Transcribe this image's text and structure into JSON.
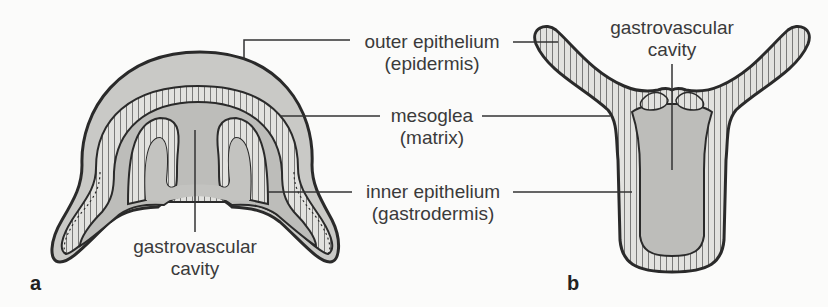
{
  "figure": {
    "panels": [
      {
        "id": "a",
        "label": "a"
      },
      {
        "id": "b",
        "label": "b"
      }
    ],
    "labels": {
      "outer_epithelium": {
        "line1": "outer epithelium",
        "line2": "(epidermis)"
      },
      "mesoglea": {
        "line1": "mesoglea",
        "line2": "(matrix)"
      },
      "inner_epithelium": {
        "line1": "inner epithelium",
        "line2": "(gastrodermis)"
      },
      "cavity_a": {
        "line1": "gastrovascular",
        "line2": "cavity"
      },
      "cavity_b": {
        "line1": "gastrovascular",
        "line2": "cavity"
      }
    },
    "colors": {
      "background": "#fbfbfa",
      "mesoglea_fill": "#c9c9c6",
      "cavity_fill": "#bdbdba",
      "cell_layer": "#e2e2df",
      "outline": "#2a2a2a",
      "leader_line": "#333333"
    }
  }
}
